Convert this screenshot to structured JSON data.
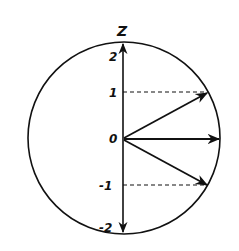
{
  "diagram": {
    "axis_label": "Z",
    "tick_labels": [
      "2",
      "1",
      "0",
      "-1",
      "-2"
    ],
    "vectors": [
      {
        "m": 2,
        "direction": "up"
      },
      {
        "m": 1,
        "direction": "upper-right"
      },
      {
        "m": 0,
        "direction": "right"
      },
      {
        "m": -1,
        "direction": "lower-right"
      },
      {
        "m": -2,
        "direction": "down"
      }
    ],
    "colors": {
      "stroke": "#111111",
      "background": "#ffffff"
    }
  }
}
